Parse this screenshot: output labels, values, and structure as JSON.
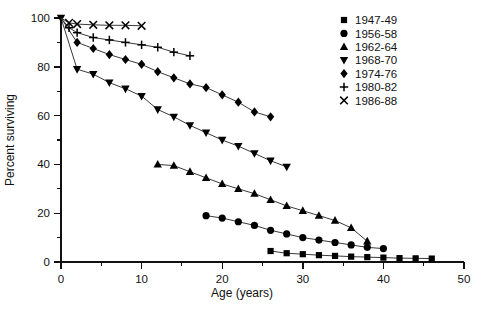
{
  "chart_data": {
    "type": "line",
    "title": "",
    "xlabel": "Age (years)",
    "ylabel": "Percent surviving",
    "xlim": [
      0,
      50
    ],
    "ylim": [
      0,
      100
    ],
    "x_major_ticks": [
      0,
      10,
      20,
      30,
      40,
      50
    ],
    "x_minor_ticks": [
      5,
      15,
      25,
      35,
      45
    ],
    "y_major_ticks": [
      0,
      20,
      40,
      60,
      80,
      100
    ],
    "y_minor_ticks": [
      10,
      30,
      50,
      70,
      90
    ],
    "x_tick_labels": [
      "0",
      "10",
      "20",
      "30",
      "40",
      "50"
    ],
    "y_tick_labels": [
      "0",
      "20",
      "40",
      "60",
      "80",
      "100"
    ],
    "grid": false,
    "legend_position": "top-right",
    "series": [
      {
        "name": "1947-49",
        "marker": "square",
        "points": [
          {
            "x": 26,
            "y": 4.5
          },
          {
            "x": 28,
            "y": 3.6
          },
          {
            "x": 30,
            "y": 3.2
          },
          {
            "x": 32,
            "y": 2.8
          },
          {
            "x": 34,
            "y": 2.5
          },
          {
            "x": 36,
            "y": 2.2
          },
          {
            "x": 38,
            "y": 2.0
          },
          {
            "x": 40,
            "y": 1.8
          },
          {
            "x": 42,
            "y": 1.6
          },
          {
            "x": 44,
            "y": 1.5
          },
          {
            "x": 46,
            "y": 1.4
          }
        ]
      },
      {
        "name": "1956-58",
        "marker": "circle",
        "points": [
          {
            "x": 18,
            "y": 19.0
          },
          {
            "x": 20,
            "y": 18.0
          },
          {
            "x": 22,
            "y": 16.5
          },
          {
            "x": 24,
            "y": 15.0
          },
          {
            "x": 26,
            "y": 13.0
          },
          {
            "x": 28,
            "y": 11.5
          },
          {
            "x": 30,
            "y": 10.0
          },
          {
            "x": 32,
            "y": 9.0
          },
          {
            "x": 34,
            "y": 8.0
          },
          {
            "x": 36,
            "y": 7.0
          },
          {
            "x": 38,
            "y": 6.0
          },
          {
            "x": 40,
            "y": 5.5
          }
        ]
      },
      {
        "name": "1962-64",
        "marker": "triangle-up",
        "points": [
          {
            "x": 12,
            "y": 40.0
          },
          {
            "x": 14,
            "y": 39.5
          },
          {
            "x": 16,
            "y": 37.0
          },
          {
            "x": 18,
            "y": 34.5
          },
          {
            "x": 20,
            "y": 32.0
          },
          {
            "x": 22,
            "y": 30.0
          },
          {
            "x": 24,
            "y": 28.0
          },
          {
            "x": 26,
            "y": 25.5
          },
          {
            "x": 28,
            "y": 23.0
          },
          {
            "x": 30,
            "y": 21.0
          },
          {
            "x": 32,
            "y": 19.0
          },
          {
            "x": 34,
            "y": 17.0
          },
          {
            "x": 36,
            "y": 14.0
          },
          {
            "x": 38,
            "y": 8.5
          }
        ]
      },
      {
        "name": "1968-70",
        "marker": "triangle-down",
        "points": [
          {
            "x": 0,
            "y": 100.0
          },
          {
            "x": 2,
            "y": 79.0
          },
          {
            "x": 4,
            "y": 77.0
          },
          {
            "x": 6,
            "y": 73.5
          },
          {
            "x": 8,
            "y": 71.0
          },
          {
            "x": 10,
            "y": 68.0
          },
          {
            "x": 12,
            "y": 62.5
          },
          {
            "x": 14,
            "y": 59.5
          },
          {
            "x": 16,
            "y": 56.0
          },
          {
            "x": 18,
            "y": 53.0
          },
          {
            "x": 20,
            "y": 50.0
          },
          {
            "x": 22,
            "y": 47.5
          },
          {
            "x": 24,
            "y": 44.5
          },
          {
            "x": 26,
            "y": 41.5
          },
          {
            "x": 28,
            "y": 39.0
          }
        ]
      },
      {
        "name": "1974-76",
        "marker": "diamond",
        "points": [
          {
            "x": 0,
            "y": 100.0
          },
          {
            "x": 2,
            "y": 90.0
          },
          {
            "x": 4,
            "y": 87.5
          },
          {
            "x": 6,
            "y": 85.0
          },
          {
            "x": 8,
            "y": 83.0
          },
          {
            "x": 10,
            "y": 81.0
          },
          {
            "x": 12,
            "y": 78.0
          },
          {
            "x": 14,
            "y": 75.5
          },
          {
            "x": 16,
            "y": 73.0
          },
          {
            "x": 18,
            "y": 71.5
          },
          {
            "x": 20,
            "y": 68.5
          },
          {
            "x": 22,
            "y": 65.5
          },
          {
            "x": 24,
            "y": 61.5
          },
          {
            "x": 26,
            "y": 59.5
          }
        ]
      },
      {
        "name": "1980-82",
        "marker": "plus",
        "points": [
          {
            "x": 0,
            "y": 100.0
          },
          {
            "x": 1,
            "y": 96.0
          },
          {
            "x": 2,
            "y": 94.0
          },
          {
            "x": 4,
            "y": 92.0
          },
          {
            "x": 6,
            "y": 91.0
          },
          {
            "x": 8,
            "y": 90.0
          },
          {
            "x": 10,
            "y": 89.0
          },
          {
            "x": 12,
            "y": 88.0
          },
          {
            "x": 14,
            "y": 86.0
          },
          {
            "x": 16,
            "y": 84.5
          }
        ]
      },
      {
        "name": "1986-88",
        "marker": "cross",
        "points": [
          {
            "x": 0,
            "y": 100.0
          },
          {
            "x": 1,
            "y": 98.0
          },
          {
            "x": 2,
            "y": 97.5
          },
          {
            "x": 4,
            "y": 97.2
          },
          {
            "x": 6,
            "y": 97.0
          },
          {
            "x": 8,
            "y": 97.0
          },
          {
            "x": 10,
            "y": 96.8
          }
        ]
      }
    ],
    "legend": [
      {
        "label": "1947-49",
        "marker": "square"
      },
      {
        "label": "1956-58",
        "marker": "circle"
      },
      {
        "label": "1962-64",
        "marker": "triangle-up"
      },
      {
        "label": "1968-70",
        "marker": "triangle-down"
      },
      {
        "label": "1974-76",
        "marker": "diamond"
      },
      {
        "label": "1980-82",
        "marker": "plus"
      },
      {
        "label": "1986-88",
        "marker": "cross"
      }
    ],
    "colors": {
      "axis": "#111111",
      "line": "#3a3a3a",
      "marker": "#000000",
      "background": "#ffffff"
    }
  }
}
